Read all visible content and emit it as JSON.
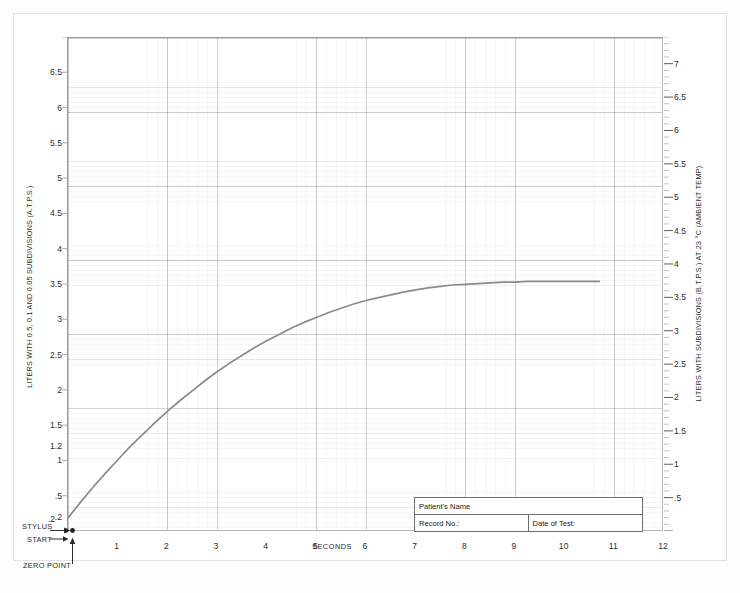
{
  "document": {
    "type": "spirogram-chart-sheet"
  },
  "axes": {
    "left": {
      "title": "LITERS WITH 0.5, 0.1 AND 0.05 SUBDIVISIONS (A.T.P.S.)",
      "ticks": [
        {
          "label": "6.5",
          "value": 6.5
        },
        {
          "label": "6",
          "value": 6
        },
        {
          "label": "5.5",
          "value": 5.5
        },
        {
          "label": "5",
          "value": 5
        },
        {
          "label": "4.5",
          "value": 4.5
        },
        {
          "label": "4",
          "value": 4
        },
        {
          "label": "3.5",
          "value": 3.5
        },
        {
          "label": "3",
          "value": 3
        },
        {
          "label": "2.5",
          "value": 2.5
        },
        {
          "label": "2",
          "value": 2
        },
        {
          "label": "1.5",
          "value": 1.5
        },
        {
          "label": "1.2",
          "value": 1.2
        },
        {
          "label": "1",
          "value": 1
        },
        {
          "label": ".5",
          "value": 0.5
        },
        {
          "label": ".2",
          "value": 0.2
        }
      ]
    },
    "right": {
      "title": "LITERS WITH SUBDIVISIONS (B.T.P.S.) AT 23 °C (AMBIENT TEMP)",
      "ticks": [
        {
          "label": "7",
          "value": 7
        },
        {
          "label": "6.5",
          "value": 6.5
        },
        {
          "label": "6",
          "value": 6
        },
        {
          "label": "5.5",
          "value": 5.5
        },
        {
          "label": "5",
          "value": 5
        },
        {
          "label": "4.5",
          "value": 4.5
        },
        {
          "label": "4",
          "value": 4
        },
        {
          "label": "3.5",
          "value": 3.5
        },
        {
          "label": "3",
          "value": 3
        },
        {
          "label": "2.5",
          "value": 2.5
        },
        {
          "label": "2",
          "value": 2
        },
        {
          "label": "1.5",
          "value": 1.5
        },
        {
          "label": "1",
          "value": 1
        },
        {
          "label": ".5",
          "value": 0.5
        }
      ]
    },
    "bottom": {
      "caption": "SECONDS",
      "ticks": [
        {
          "label": "1",
          "value": 1
        },
        {
          "label": "2",
          "value": 2
        },
        {
          "label": "3",
          "value": 3
        },
        {
          "label": "4",
          "value": 4
        },
        {
          "label": "5",
          "value": 5
        },
        {
          "label": "6",
          "value": 6
        },
        {
          "label": "7",
          "value": 7
        },
        {
          "label": "8",
          "value": 8
        },
        {
          "label": "9",
          "value": 9
        },
        {
          "label": "10",
          "value": 10
        },
        {
          "label": "11",
          "value": 11
        },
        {
          "label": "12",
          "value": 12
        }
      ]
    }
  },
  "markers": {
    "stylus_label": "STYLUS",
    "start_label": "START",
    "zero_point_label": "ZERO POINT",
    "stylus_tick_label": ".2"
  },
  "patient_box": {
    "name_label": "Patient's Name",
    "name_value": "",
    "record_label": "Record No.:",
    "record_value": "",
    "date_label": "Date of Test:",
    "date_value": ""
  },
  "colors": {
    "trace": "#8a8a8a",
    "frame": "#9a9a9a",
    "grid_major": "#d6d6d6",
    "grid_minor": "#eeeeee",
    "paper": "#fefefe",
    "text": "#2c2c2c"
  },
  "chart_data": {
    "type": "line",
    "title": "",
    "subtitle": "",
    "xlabel": "SECONDS",
    "ylabel": "LITERS WITH 0.5, 0.1 AND 0.05 SUBDIVISIONS (A.T.P.S.)",
    "y2label": "LITERS WITH SUBDIVISIONS (B.T.P.S.) AT 23 °C (AMBIENT TEMP)",
    "xlim": [
      0,
      12
    ],
    "ylim": [
      0,
      7
    ],
    "y2lim": [
      0,
      7.4
    ],
    "grid": true,
    "legend": null,
    "series": [
      {
        "name": "Slow vital capacity spirogram trace",
        "color": "#8a8a8a",
        "x": [
          0.0,
          0.25,
          0.5,
          0.75,
          1.0,
          1.25,
          1.5,
          1.75,
          2.0,
          2.25,
          2.5,
          2.75,
          3.0,
          3.25,
          3.5,
          3.75,
          4.0,
          4.25,
          4.5,
          4.75,
          5.0,
          5.25,
          5.5,
          5.75,
          6.0,
          6.25,
          6.5,
          6.75,
          7.0,
          7.25,
          7.5,
          7.75,
          8.0,
          8.25,
          8.5,
          8.75,
          9.0,
          9.25,
          9.5,
          9.75,
          10.0,
          10.25,
          10.5,
          10.7
        ],
        "y": [
          0.2,
          0.42,
          0.63,
          0.83,
          1.02,
          1.21,
          1.38,
          1.55,
          1.71,
          1.86,
          2.0,
          2.14,
          2.27,
          2.39,
          2.5,
          2.61,
          2.71,
          2.8,
          2.89,
          2.97,
          3.04,
          3.11,
          3.17,
          3.23,
          3.28,
          3.32,
          3.36,
          3.4,
          3.43,
          3.46,
          3.48,
          3.5,
          3.51,
          3.52,
          3.53,
          3.54,
          3.54,
          3.55,
          3.55,
          3.55,
          3.55,
          3.55,
          3.55,
          3.55
        ]
      }
    ],
    "annotations": [
      {
        "text": "STYLUS",
        "x": 0.0,
        "y": 0.2
      },
      {
        "text": "START",
        "x": 0.0,
        "y": 0.1
      },
      {
        "text": "ZERO POINT",
        "x": 0.0,
        "y": 0.0
      }
    ]
  }
}
